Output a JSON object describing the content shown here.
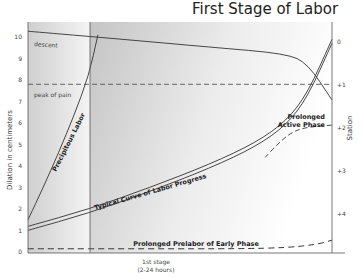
{
  "chart_data": {
    "type": "line",
    "title": "First Stage of Labor",
    "xlabel_line1": "1st stage",
    "xlabel_line2": "(2-24 hours)",
    "ylabel": "Dilation in centimeters",
    "y2label": "Station",
    "ylim": [
      0,
      10
    ],
    "y_ticks": [
      "0",
      "1",
      "2",
      "3",
      "4",
      "5",
      "6",
      "7",
      "8",
      "9",
      "10"
    ],
    "y2_ticks": [
      "0",
      "+1",
      "+2",
      "+3",
      "+4"
    ],
    "xlim": [
      0,
      1
    ],
    "shaded_phase_boundary_x": 0.2,
    "reference_lines": [
      {
        "name": "peak of pain",
        "y": 7.8,
        "style": "dashed"
      }
    ],
    "series": [
      {
        "name": "descent",
        "axis": "station",
        "style": "solid",
        "x": [
          0,
          0.3,
          0.6,
          0.85,
          0.92,
          1.0
        ],
        "y": [
          -0.25,
          -0.07,
          0.12,
          0.27,
          0.5,
          1.35
        ]
      },
      {
        "name": "Precipitous Labor",
        "axis": "dilation",
        "style": "solid",
        "x": [
          0,
          0.05,
          0.1,
          0.15,
          0.2,
          0.23
        ],
        "y": [
          1.5,
          3.0,
          4.6,
          6.3,
          8.2,
          10.1
        ]
      },
      {
        "name": "Typical Curve of Labor Progress",
        "axis": "dilation",
        "style": "double",
        "x": [
          0,
          0.2,
          0.4,
          0.6,
          0.75,
          0.85,
          0.92,
          1.0
        ],
        "y": [
          1.1,
          1.9,
          2.9,
          4.0,
          5.0,
          6.0,
          7.3,
          9.8
        ]
      },
      {
        "name": "Prolonged Active Phase",
        "axis": "dilation",
        "style": "solid+dashed",
        "x": [
          0.78,
          0.82,
          0.86,
          0.9,
          0.95,
          1.0
        ],
        "y": [
          4.4,
          5.0,
          5.5,
          5.75,
          5.85,
          5.9
        ]
      },
      {
        "name": "Prolonged Prelabor of Early Phase",
        "axis": "dilation",
        "style": "dashed",
        "x": [
          0,
          0.4,
          0.7,
          0.85,
          0.95,
          1.0
        ],
        "y": [
          0.15,
          0.15,
          0.15,
          0.2,
          0.35,
          0.55
        ]
      }
    ],
    "annotations": [
      {
        "text": "descent"
      },
      {
        "text": "peak of pain"
      },
      {
        "text": "Precipitous Labor"
      },
      {
        "text": "Typical Curve of Labor Progress"
      },
      {
        "text": "Prolonged"
      },
      {
        "text": "Active Phase"
      },
      {
        "text": "Prolonged Prelabor of Early Phase"
      }
    ]
  }
}
